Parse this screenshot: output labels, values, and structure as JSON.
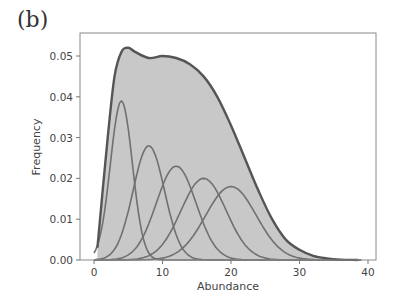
{
  "panel_label": "(b)",
  "chart_data": {
    "type": "area",
    "title": "",
    "panel": "(b)",
    "xlabel": "Abundance",
    "ylabel": "Frequency",
    "xlim": [
      -2,
      41
    ],
    "ylim": [
      0,
      0.055
    ],
    "xticks": [
      0,
      10,
      20,
      30,
      40
    ],
    "yticks": [
      0.0,
      0.01,
      0.02,
      0.03,
      0.04,
      0.05
    ],
    "ytick_labels": [
      "0.00",
      "0.01",
      "0.02",
      "0.03",
      "0.04",
      "0.05"
    ],
    "grid": false,
    "legend": null,
    "envelope": {
      "name": "Total distribution (filled)",
      "x": [
        0.5,
        2,
        3,
        4,
        5,
        6,
        8,
        10,
        12,
        14,
        16,
        18,
        20,
        22,
        24,
        26,
        28,
        30,
        32,
        34,
        36,
        38.5
      ],
      "y": [
        0.003,
        0.03,
        0.045,
        0.051,
        0.052,
        0.051,
        0.0495,
        0.05,
        0.0495,
        0.048,
        0.045,
        0.04,
        0.033,
        0.025,
        0.017,
        0.01,
        0.005,
        0.0025,
        0.001,
        0.0004,
        0.0001,
        0.0
      ]
    },
    "series": [
      {
        "name": "Component 1",
        "peak_x": 4,
        "peak_y": 0.039,
        "sigma": 1.6
      },
      {
        "name": "Component 2",
        "peak_x": 8,
        "peak_y": 0.028,
        "sigma": 2.3
      },
      {
        "name": "Component 3",
        "peak_x": 12,
        "peak_y": 0.023,
        "sigma": 2.9
      },
      {
        "name": "Component 4",
        "peak_x": 16,
        "peak_y": 0.02,
        "sigma": 3.3
      },
      {
        "name": "Component 5",
        "peak_x": 20,
        "peak_y": 0.018,
        "sigma": 3.7
      }
    ],
    "colors": {
      "fill": "#c8c8c8",
      "envelope": "#555555",
      "components": "#707070",
      "axes": "#888888"
    }
  }
}
